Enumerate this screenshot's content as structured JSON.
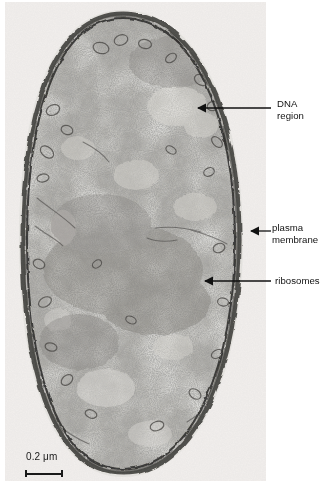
{
  "figure": {
    "type": "transmission-electron-micrograph",
    "scale_bar": {
      "value": "0.2",
      "unit": "μm",
      "text": "0.2 μm"
    }
  },
  "annotations": [
    {
      "id": "dna-region",
      "label": "DNA\nregion",
      "label_line1": "DNA",
      "label_line2": "region",
      "arrow": {
        "x1": 271,
        "y1": 108,
        "x2": 197,
        "y2": 108
      }
    },
    {
      "id": "plasma-membrane",
      "label": "plasma\nmembrane",
      "label_line1": "plasma",
      "label_line2": "membrane",
      "arrow": {
        "x1": 271,
        "y1": 231,
        "x2": 250,
        "y2": 231
      }
    },
    {
      "id": "ribosomes",
      "label": "ribosomes",
      "label_line1": "ribosomes",
      "label_line2": "",
      "arrow": {
        "x1": 271,
        "y1": 281,
        "x2": 204,
        "y2": 281
      }
    }
  ],
  "colors": {
    "background": "#ffffff",
    "panel_background": "#f4f3f1",
    "cytoplasm_mid": "#9a9894",
    "cytoplasm_light": "#cfcdc8",
    "membrane_dark": "#2a2a2a",
    "label_text": "#111111",
    "arrow": "#111111"
  }
}
